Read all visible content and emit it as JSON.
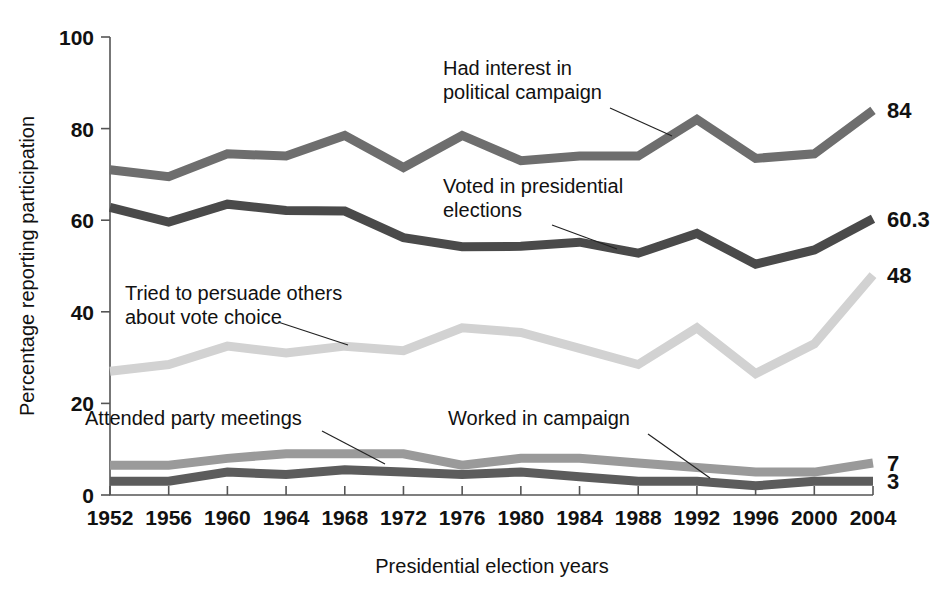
{
  "chart_data": {
    "type": "line",
    "title": "",
    "xlabel": "Presidential election years",
    "ylabel": "Percentage reporting participation",
    "categories": [
      "1952",
      "1956",
      "1960",
      "1964",
      "1968",
      "1972",
      "1976",
      "1980",
      "1984",
      "1988",
      "1992",
      "1996",
      "2000",
      "2004"
    ],
    "xlim": [
      1952,
      2004
    ],
    "ylim": [
      0,
      100
    ],
    "yticks": [
      0,
      20,
      40,
      60,
      80,
      100
    ],
    "grid": false,
    "legend_position": "inline-annotations",
    "series": [
      {
        "name": "Had interest in political campaign",
        "color": "#6e6e6e",
        "values": [
          71,
          69.5,
          74.5,
          74,
          78.5,
          71.5,
          78.5,
          73,
          74,
          74,
          82,
          73.5,
          74.5,
          84
        ],
        "end_label": "84",
        "annotation": {
          "lines": [
            "Had interest in",
            "political campaign"
          ],
          "x": 443,
          "y": 75
        },
        "leader": {
          "x1": 610,
          "y1": 108,
          "x2": 672,
          "y2": 136
        }
      },
      {
        "name": "Voted in presidential elections",
        "color": "#4a4a4a",
        "values": [
          62.8,
          59.6,
          63.5,
          62.1,
          62,
          56.2,
          54.2,
          54.3,
          55.2,
          52.8,
          57.1,
          50.4,
          53.5,
          60.3
        ],
        "end_label": "60.3",
        "annotation": {
          "lines": [
            "Voted in presidential",
            "elections"
          ],
          "x": 443,
          "y": 193
        },
        "leader": {
          "x1": 552,
          "y1": 225,
          "x2": 617,
          "y2": 249
        }
      },
      {
        "name": "Tried to persuade others about vote choice",
        "color": "#d2d2d2",
        "values": [
          27,
          28.5,
          32.5,
          31,
          32.5,
          31.5,
          36.5,
          35.5,
          32,
          28.5,
          36.5,
          26.5,
          33,
          48
        ],
        "end_label": "48",
        "annotation": {
          "lines": [
            "Tried to persuade others",
            "about vote choice"
          ],
          "x": 125,
          "y": 300
        },
        "leader": {
          "x1": 278,
          "y1": 322,
          "x2": 348,
          "y2": 345
        }
      },
      {
        "name": "Attended party meetings",
        "color": "#9a9a9a",
        "values": [
          6.5,
          6.5,
          8,
          9,
          9,
          9,
          6.5,
          8,
          8,
          7,
          6,
          5,
          5,
          7
        ],
        "end_label": "7",
        "annotation": {
          "lines": [
            "Attended party meetings"
          ],
          "x": 85,
          "y": 425
        },
        "leader": {
          "x1": 322,
          "y1": 431,
          "x2": 385,
          "y2": 464
        }
      },
      {
        "name": "Worked in campaign",
        "color": "#5c5c5c",
        "values": [
          3,
          3,
          5,
          4.5,
          5.5,
          5,
          4.5,
          5,
          4,
          3,
          3,
          2,
          3,
          3
        ],
        "end_label": "3",
        "annotation": {
          "lines": [
            "Worked in campaign"
          ],
          "x": 448,
          "y": 425
        },
        "leader": {
          "x1": 648,
          "y1": 434,
          "x2": 710,
          "y2": 478
        }
      }
    ]
  },
  "plot_geometry": {
    "left": 110,
    "right": 873,
    "top": 37,
    "bottom": 495,
    "label_x_offset": 14
  }
}
